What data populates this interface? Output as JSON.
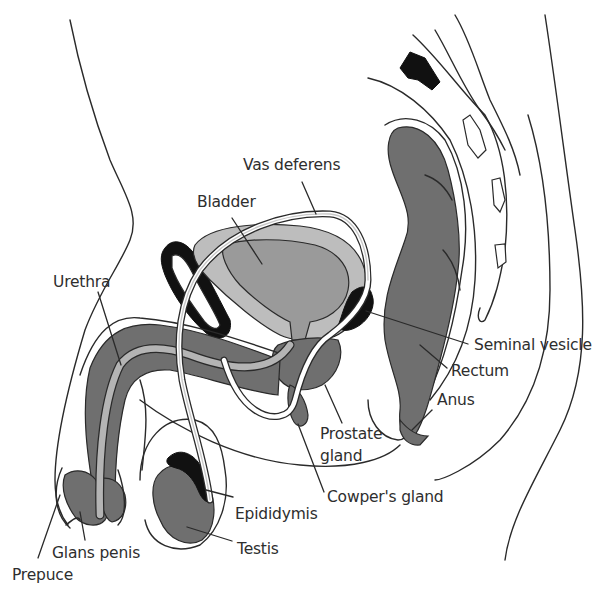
{
  "diagram": {
    "colors": {
      "background": "#ffffff",
      "outline": "#2a2a2a",
      "dark_tissue": "#6f6f6f",
      "light_tissue": "#bdbdbd",
      "black_bone": "#111111",
      "label_text": "#2e2e2e"
    },
    "labels": {
      "vas_deferens": "Vas deferens",
      "bladder": "Bladder",
      "urethra": "Urethra",
      "seminal_vesicle": "Seminal vesicle",
      "rectum": "Rectum",
      "anus": "Anus",
      "prostate_gland_line1": "Prostate",
      "prostate_gland_line2": "gland",
      "cowpers_gland": "Cowper's gland",
      "epididymis": "Epididymis",
      "testis": "Testis",
      "glans_penis": "Glans penis",
      "prepuce": "Prepuce"
    }
  }
}
